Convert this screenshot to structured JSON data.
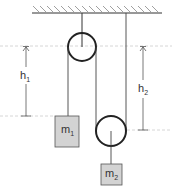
{
  "diagram": {
    "masses": [
      {
        "id": "m1",
        "label": "m",
        "subscript": "1"
      },
      {
        "id": "m2",
        "label": "m",
        "subscript": "2"
      }
    ],
    "heights": [
      {
        "id": "h1",
        "label": "h",
        "subscript": "1"
      },
      {
        "id": "h2",
        "label": "h",
        "subscript": "2"
      }
    ],
    "colors": {
      "line": "#333333",
      "mass_fill": "#d3d3d3",
      "dashed": "#c8c8c8"
    }
  }
}
